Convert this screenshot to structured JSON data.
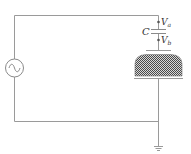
{
  "diagram": {
    "type": "circuit",
    "components": {
      "source": {
        "kind": "ac-voltage-source",
        "symbol": "~"
      },
      "capacitor": {
        "label": "C"
      },
      "node_a": {
        "label": "V",
        "subscript": "a"
      },
      "node_b": {
        "label": "V",
        "subscript": "b"
      },
      "electrode": {
        "kind": "hatched-dome-electrode"
      },
      "ground": {
        "kind": "ground"
      }
    },
    "colors": {
      "wire": "#9a9a9a",
      "hatch": "#555555",
      "text": "#333333"
    }
  }
}
